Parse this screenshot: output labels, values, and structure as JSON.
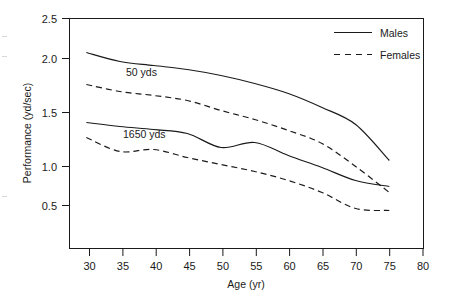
{
  "chart_data": {
    "type": "line",
    "title": "",
    "xlabel": "Age (yr)",
    "ylabel": "Performance (yd/sec)",
    "xlim": [
      27.5,
      80
    ],
    "ylim": [
      0.2,
      2.5
    ],
    "xticks": [
      30,
      35,
      40,
      45,
      50,
      55,
      60,
      65,
      70,
      75,
      80
    ],
    "yticks": [
      0.5,
      1.0,
      1.5,
      2.0,
      2.5
    ],
    "xtick_labels": [
      "30",
      "35",
      "40",
      "45",
      "50",
      "55",
      "60",
      "65",
      "70",
      "75",
      "80"
    ],
    "ytick_labels": [
      "0.5",
      "1.0",
      "1.5",
      "2.0",
      "2.5"
    ],
    "grid": false,
    "legend_position": "top-right",
    "legend": [
      {
        "name": "Males",
        "style": "solid"
      },
      {
        "name": "Females",
        "style": "dashed"
      }
    ],
    "annotations": [
      {
        "text": "50 yds",
        "x": 36.5,
        "y": 1.93
      },
      {
        "text": "1650 yds",
        "x": 37.0,
        "y": 1.25
      }
    ],
    "x": [
      30,
      35,
      40,
      45,
      50,
      55,
      60,
      65,
      70,
      75
    ],
    "series": [
      {
        "name": "Males 50 yds",
        "group": "50 yds",
        "sex": "Males",
        "style": "solid",
        "values": [
          2.16,
          2.07,
          2.03,
          1.99,
          1.93,
          1.85,
          1.75,
          1.61,
          1.44,
          1.08
        ]
      },
      {
        "name": "Females 50 yds",
        "group": "50 yds",
        "sex": "Females",
        "style": "dashed",
        "values": [
          1.84,
          1.77,
          1.73,
          1.68,
          1.58,
          1.49,
          1.38,
          1.25,
          1.02,
          0.76
        ]
      },
      {
        "name": "Males 1650 yds",
        "group": "1650 yds",
        "sex": "Males",
        "style": "solid",
        "values": [
          1.46,
          1.42,
          1.39,
          1.35,
          1.21,
          1.26,
          1.13,
          1.01,
          0.88,
          0.82
        ]
      },
      {
        "name": "Females 1650 yds",
        "group": "1650 yds",
        "sex": "Females",
        "style": "dashed",
        "values": [
          1.31,
          1.17,
          1.19,
          1.11,
          1.04,
          0.97,
          0.88,
          0.76,
          0.6,
          0.58
        ]
      }
    ]
  },
  "axes": {
    "x_title": "Age (yr)",
    "y_title": "Performance (yd/sec)",
    "x_ticks": [
      "30",
      "35",
      "40",
      "45",
      "50",
      "55",
      "60",
      "65",
      "70",
      "75",
      "80"
    ],
    "y_ticks": [
      "2.5",
      "2.0",
      "1.5",
      "1.0",
      "0.5"
    ]
  },
  "legend": {
    "males_label": "Males",
    "females_label": "Females"
  },
  "series_labels": {
    "sprint": "50 yds",
    "distance": "1650 yds"
  },
  "colors": {
    "line": "#1a1a1a",
    "axis": "#1a1a1a",
    "background": "#ffffff"
  }
}
